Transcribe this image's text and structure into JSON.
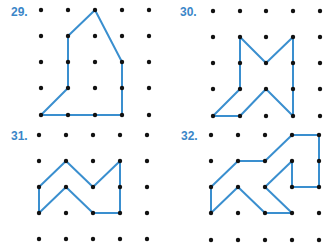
{
  "accent_color": "#3a8fcf",
  "dot_color": "#111111",
  "figures": [
    {
      "label": "29.",
      "label_pos": [
        11,
        5
      ],
      "grid_x": [
        41,
        68,
        95,
        122,
        149
      ],
      "grid_y": [
        10,
        36,
        62,
        88,
        115
      ],
      "polygon": [
        [
          41,
          115
        ],
        [
          68,
          88
        ],
        [
          68,
          36
        ],
        [
          95,
          10
        ],
        [
          122,
          62
        ],
        [
          122,
          115
        ]
      ]
    },
    {
      "label": "30.",
      "label_pos": [
        180,
        5
      ],
      "grid_x": [
        213,
        240,
        266,
        293,
        320
      ],
      "grid_y": [
        11,
        37,
        63,
        89,
        116
      ],
      "polygon": [
        [
          213,
          116
        ],
        [
          240,
          116
        ],
        [
          266,
          89
        ],
        [
          293,
          116
        ],
        [
          293,
          37
        ],
        [
          266,
          63
        ],
        [
          240,
          37
        ],
        [
          240,
          89
        ]
      ]
    },
    {
      "label": "31.",
      "label_pos": [
        11,
        129
      ],
      "grid_x": [
        39,
        66,
        93,
        120,
        147
      ],
      "grid_y": [
        135,
        161,
        187,
        213,
        239
      ],
      "polygon": [
        [
          39,
          187
        ],
        [
          66,
          161
        ],
        [
          93,
          187
        ],
        [
          120,
          161
        ],
        [
          120,
          213
        ],
        [
          93,
          213
        ],
        [
          66,
          187
        ],
        [
          39,
          213
        ]
      ]
    },
    {
      "label": "32.",
      "label_pos": [
        181,
        129
      ],
      "grid_x": [
        211,
        238,
        265,
        292,
        319
      ],
      "grid_y": [
        135,
        161,
        187,
        213,
        240
      ],
      "polygon": [
        [
          211,
          213
        ],
        [
          211,
          187
        ],
        [
          238,
          161
        ],
        [
          265,
          161
        ],
        [
          292,
          135
        ],
        [
          319,
          135
        ],
        [
          319,
          187
        ],
        [
          292,
          187
        ],
        [
          292,
          161
        ],
        [
          265,
          187
        ],
        [
          292,
          213
        ],
        [
          265,
          213
        ],
        [
          238,
          187
        ]
      ]
    }
  ]
}
